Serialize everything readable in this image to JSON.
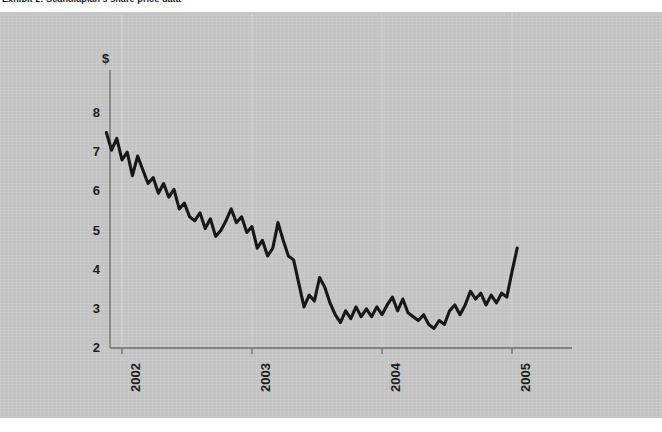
{
  "title": "Exhibit 2: Scandiaplan's share price data",
  "panel": {
    "background_color": "#c9c9c9",
    "page_background_color": "#ffffff"
  },
  "axes": {
    "currency_symbol": "$",
    "y_ticks": [
      "2",
      "3",
      "4",
      "5",
      "6",
      "7",
      "8"
    ],
    "x_ticks": [
      "2002",
      "2003",
      "2004",
      "2005"
    ],
    "axis_color": "#6e6e6e",
    "gridline_color": "#d6d6d6",
    "line_color": "#171717"
  },
  "chart_data": {
    "type": "line",
    "title": "Exhibit 2: Scandiaplan's share price data",
    "xlabel": "",
    "ylabel": "$",
    "ylim": [
      2,
      8.4
    ],
    "xlim": [
      2001.85,
      2005.3
    ],
    "grid": "vertical-only",
    "legend": "none",
    "series": [
      {
        "name": "Share price",
        "color": "#171717",
        "x": [
          2001.88,
          2001.92,
          2001.96,
          2002.0,
          2002.04,
          2002.08,
          2002.12,
          2002.16,
          2002.2,
          2002.24,
          2002.28,
          2002.32,
          2002.36,
          2002.4,
          2002.44,
          2002.48,
          2002.52,
          2002.56,
          2002.6,
          2002.64,
          2002.68,
          2002.72,
          2002.76,
          2002.8,
          2002.84,
          2002.88,
          2002.92,
          2002.96,
          2003.0,
          2003.04,
          2003.08,
          2003.12,
          2003.16,
          2003.2,
          2003.24,
          2003.28,
          2003.32,
          2003.36,
          2003.4,
          2003.44,
          2003.48,
          2003.52,
          2003.56,
          2003.6,
          2003.64,
          2003.68,
          2003.72,
          2003.76,
          2003.8,
          2003.84,
          2003.88,
          2003.92,
          2003.96,
          2004.0,
          2004.04,
          2004.08,
          2004.12,
          2004.16,
          2004.2,
          2004.24,
          2004.28,
          2004.32,
          2004.36,
          2004.4,
          2004.44,
          2004.48,
          2004.52,
          2004.56,
          2004.6,
          2004.64,
          2004.68,
          2004.72,
          2004.76,
          2004.8,
          2004.84,
          2004.88,
          2004.92,
          2004.96,
          2005.0,
          2005.04
        ],
        "y": [
          7.5,
          7.05,
          7.35,
          6.8,
          7.0,
          6.4,
          6.9,
          6.55,
          6.2,
          6.35,
          5.95,
          6.2,
          5.85,
          6.05,
          5.55,
          5.7,
          5.35,
          5.25,
          5.45,
          5.05,
          5.3,
          4.85,
          5.0,
          5.25,
          5.55,
          5.2,
          5.35,
          4.95,
          5.1,
          4.55,
          4.75,
          4.35,
          4.55,
          5.2,
          4.75,
          4.35,
          4.25,
          3.65,
          3.05,
          3.35,
          3.2,
          3.8,
          3.55,
          3.15,
          2.85,
          2.65,
          2.95,
          2.75,
          3.05,
          2.8,
          3.0,
          2.8,
          3.05,
          2.85,
          3.1,
          3.3,
          2.95,
          3.25,
          2.9,
          2.8,
          2.7,
          2.85,
          2.6,
          2.5,
          2.7,
          2.6,
          2.95,
          3.1,
          2.85,
          3.1,
          3.45,
          3.25,
          3.4,
          3.1,
          3.35,
          3.15,
          3.4,
          3.3,
          3.95,
          4.55
        ]
      }
    ]
  }
}
